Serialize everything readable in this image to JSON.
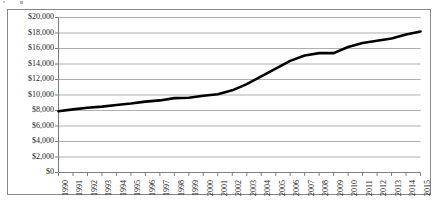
{
  "chart_data": {
    "type": "line",
    "title": "",
    "subtitle": "",
    "xlabel": "",
    "ylabel": "",
    "grid": true,
    "legend": false,
    "legend_position": "none",
    "xlim": [
      1990,
      2015
    ],
    "ylim": [
      0,
      20000
    ],
    "ytick_interval": 2000,
    "categories": [
      "1990",
      "1991",
      "1992",
      "1993",
      "1994",
      "1995",
      "1996",
      "1997",
      "1998",
      "1999",
      "2000",
      "2001",
      "2002",
      "2003",
      "2004",
      "2005",
      "2006",
      "2007",
      "2008",
      "2009",
      "2010",
      "2011",
      "2012",
      "2013",
      "2014",
      "2015"
    ],
    "values": [
      7900,
      8150,
      8350,
      8500,
      8700,
      8900,
      9150,
      9300,
      9600,
      9650,
      9900,
      10100,
      10600,
      11400,
      12400,
      13400,
      14400,
      15100,
      15400,
      15400,
      16200,
      16700,
      17000,
      17300,
      17800,
      18200
    ],
    "ytick_labels": [
      "$20,000",
      "$18,000",
      "$16,000",
      "$14,000",
      "$12,000",
      "$10,000",
      "$8,000",
      "$6,000",
      "$4,000",
      "$2,000",
      "$0"
    ],
    "ytick_values": [
      20000,
      18000,
      16000,
      14000,
      12000,
      10000,
      8000,
      6000,
      4000,
      2000,
      0
    ],
    "series_color": "#000000",
    "gridline_color": "#a6a6a6",
    "axis_color": "#808080",
    "frame_color": "#888888",
    "background_color": "#ffffff"
  }
}
